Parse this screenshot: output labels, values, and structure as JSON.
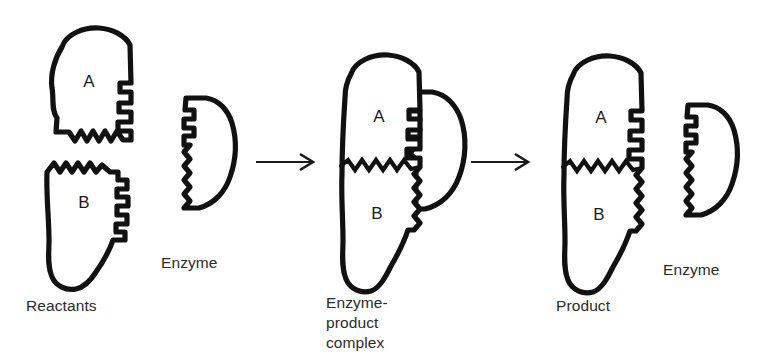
{
  "figure": {
    "background_color": "#ffffff",
    "ink_color": "#111111",
    "stage_count": 3
  },
  "stages": [
    {
      "id": "reactants",
      "caption": "Reactants",
      "shapes": [
        {
          "id": "reactant-a",
          "letter": "A"
        },
        {
          "id": "reactant-b",
          "letter": "B"
        }
      ]
    },
    {
      "id": "enzyme-free-left",
      "caption": "Enzyme",
      "shapes": [
        {
          "id": "enzyme-left",
          "letter": ""
        }
      ]
    },
    {
      "id": "enzyme-product-complex",
      "caption_lines": [
        "Enzyme-",
        "product",
        "complex"
      ],
      "shapes": [
        {
          "id": "complex-substrate",
          "letter_a": "A",
          "letter_b": "B"
        },
        {
          "id": "complex-enzyme",
          "letter": ""
        }
      ]
    },
    {
      "id": "product",
      "caption": "Product",
      "shapes": [
        {
          "id": "product-body",
          "letter_a": "A",
          "letter_b": "B"
        }
      ]
    },
    {
      "id": "enzyme-free-right",
      "caption": "Enzyme",
      "shapes": [
        {
          "id": "enzyme-right",
          "letter": ""
        }
      ]
    }
  ],
  "labels": {
    "reactants": "Reactants",
    "enzyme_left": "Enzyme",
    "complex_line1": "Enzyme-",
    "complex_line2": "product",
    "complex_line3": "complex",
    "product": "Product",
    "enzyme_right": "Enzyme",
    "letter_a_reactant": "A",
    "letter_b_reactant": "B",
    "letter_a_complex": "A",
    "letter_b_complex": "B",
    "letter_a_product": "A",
    "letter_b_product": "B"
  },
  "arrows": [
    {
      "id": "arrow-1",
      "from": "reactants-and-enzyme",
      "to": "enzyme-product-complex"
    },
    {
      "id": "arrow-2",
      "from": "enzyme-product-complex",
      "to": "product-and-enzyme"
    }
  ]
}
